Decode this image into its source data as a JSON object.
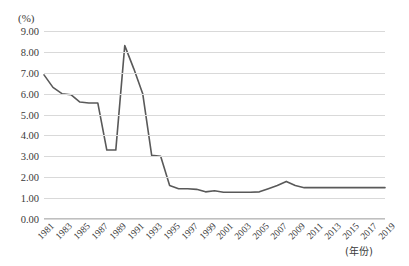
{
  "chart_data": {
    "type": "line",
    "title": "",
    "subtitle": "",
    "xlabel": "(年份)",
    "ylabel": "(%)",
    "ylim": [
      0,
      9
    ],
    "ytick_step": 1,
    "grid": true,
    "legend": false,
    "legend_position": "none",
    "line_color": "#595959",
    "grid_color": "#d9d9d9",
    "axis_color": "#bfbfbf",
    "ytick_labels": [
      "9.00",
      "8.00",
      "7.00",
      "6.00",
      "5.00",
      "4.00",
      "3.00",
      "2.00",
      "1.00",
      "0.00"
    ],
    "ytick_values": [
      9,
      8,
      7,
      6,
      5,
      4,
      3,
      2,
      1,
      0
    ],
    "xtick_labels": [
      "1981",
      "1983",
      "1985",
      "1987",
      "1989",
      "1991",
      "1993",
      "1995",
      "1997",
      "1999",
      "2001",
      "2003",
      "2005",
      "2007",
      "2009",
      "2011",
      "2013",
      "2015",
      "2017",
      "2019"
    ],
    "x": [
      1981,
      1982,
      1983,
      1984,
      1985,
      1986,
      1987,
      1988,
      1989,
      1990,
      1991,
      1992,
      1993,
      1994,
      1995,
      1996,
      1997,
      1998,
      1999,
      2000,
      2001,
      2002,
      2003,
      2004,
      2005,
      2006,
      2007,
      2008,
      2009,
      2010,
      2011,
      2012,
      2013,
      2014,
      2015,
      2016,
      2017,
      2018,
      2019
    ],
    "values": [
      6.9,
      6.3,
      6.0,
      5.95,
      5.6,
      5.55,
      5.55,
      3.3,
      3.3,
      8.3,
      7.2,
      6.0,
      3.05,
      3.0,
      1.6,
      1.45,
      1.45,
      1.42,
      1.3,
      1.35,
      1.28,
      1.28,
      1.28,
      1.28,
      1.3,
      1.45,
      1.6,
      1.8,
      1.6,
      1.5,
      1.5,
      1.5,
      1.5,
      1.5,
      1.5,
      1.5,
      1.5,
      1.5,
      1.5
    ]
  },
  "axis": {
    "unit_label": "(%)",
    "x_title": "(年份)"
  }
}
